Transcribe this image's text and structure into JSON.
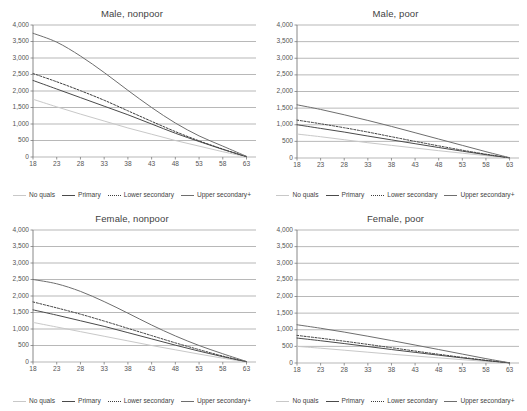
{
  "figure": {
    "panel_count": 4,
    "background": "#ffffff",
    "grid_color": "#9a9a9a",
    "axis_color": "#7a7a7a",
    "text_color": "#3f3f3f"
  },
  "series_style": {
    "No quals": {
      "color": "#c8c8c8",
      "dash": "none",
      "width": 1.0
    },
    "Primary": {
      "color": "#4a4a4a",
      "dash": "none",
      "width": 1.0
    },
    "Lower secondary": {
      "color": "#3d3d3d",
      "dash": "2,1.6",
      "width": 1.0
    },
    "Upper secondary+": {
      "color": "#6e6e6e",
      "dash": "none",
      "width": 1.0
    }
  },
  "legend": {
    "items": [
      {
        "label": "No quals"
      },
      {
        "label": "Primary"
      },
      {
        "label": "Lower secondary"
      },
      {
        "label": "Upper secondary+"
      }
    ]
  },
  "chart_data": [
    {
      "type": "line",
      "title": "Male, nonpoor",
      "xlabel": "",
      "ylabel": "",
      "xlim": [
        18,
        65
      ],
      "ylim": [
        0,
        4000
      ],
      "grid": true,
      "legend_position": "bottom",
      "xticks": [
        18,
        23,
        28,
        33,
        38,
        43,
        48,
        53,
        58,
        63
      ],
      "xtick_labels": [
        "18",
        "23",
        "28",
        "33",
        "38",
        "43",
        "48",
        "53",
        "58",
        "63"
      ],
      "yticks": [
        0,
        500,
        1000,
        1500,
        2000,
        2500,
        3000,
        3500,
        4000
      ],
      "ytick_labels": [
        "0",
        "500",
        "1,000",
        "1,500",
        "2,000",
        "2,500",
        "3,000",
        "3,500",
        "4,000"
      ],
      "x": [
        18,
        23,
        28,
        33,
        38,
        43,
        48,
        53,
        58,
        63
      ],
      "series": [
        {
          "name": "No quals",
          "values": [
            1750,
            1520,
            1300,
            1090,
            880,
            690,
            500,
            330,
            160,
            10
          ]
        },
        {
          "name": "Primary",
          "values": [
            2320,
            2060,
            1800,
            1540,
            1280,
            1000,
            720,
            470,
            230,
            10
          ]
        },
        {
          "name": "Lower secondary",
          "values": [
            2530,
            2280,
            2010,
            1720,
            1400,
            1080,
            770,
            490,
            240,
            10
          ]
        },
        {
          "name": "Upper secondary+",
          "values": [
            3750,
            3480,
            3060,
            2560,
            2020,
            1500,
            1030,
            640,
            330,
            20
          ]
        }
      ]
    },
    {
      "type": "line",
      "title": "Male, poor",
      "xlabel": "",
      "ylabel": "",
      "xlim": [
        18,
        65
      ],
      "ylim": [
        0,
        4000
      ],
      "grid": true,
      "legend_position": "bottom",
      "xticks": [
        18,
        23,
        28,
        33,
        38,
        43,
        48,
        53,
        58,
        63
      ],
      "xtick_labels": [
        "18",
        "23",
        "28",
        "33",
        "38",
        "43",
        "48",
        "53",
        "58",
        "63"
      ],
      "yticks": [
        0,
        500,
        1000,
        1500,
        2000,
        2500,
        3000,
        3500,
        4000
      ],
      "ytick_labels": [
        "0",
        "500",
        "1,000",
        "1,500",
        "2,000",
        "2,500",
        "3,000",
        "3,500",
        "4,000"
      ],
      "x": [
        18,
        23,
        28,
        33,
        38,
        43,
        48,
        53,
        58,
        63
      ],
      "series": [
        {
          "name": "No quals",
          "values": [
            720,
            640,
            550,
            460,
            380,
            300,
            220,
            145,
            70,
            5
          ]
        },
        {
          "name": "Primary",
          "values": [
            1000,
            890,
            780,
            660,
            545,
            430,
            315,
            205,
            100,
            5
          ]
        },
        {
          "name": "Lower secondary",
          "values": [
            1140,
            1030,
            910,
            780,
            640,
            500,
            365,
            235,
            115,
            5
          ]
        },
        {
          "name": "Upper secondary+",
          "values": [
            1600,
            1460,
            1300,
            1130,
            950,
            760,
            570,
            380,
            190,
            10
          ]
        }
      ]
    },
    {
      "type": "line",
      "title": "Female, nonpoor",
      "xlabel": "",
      "ylabel": "",
      "xlim": [
        18,
        65
      ],
      "ylim": [
        0,
        4000
      ],
      "grid": true,
      "legend_position": "bottom",
      "xticks": [
        18,
        23,
        28,
        33,
        38,
        43,
        48,
        53,
        58,
        63
      ],
      "xtick_labels": [
        "18",
        "23",
        "28",
        "33",
        "38",
        "43",
        "48",
        "53",
        "58",
        "63"
      ],
      "yticks": [
        0,
        500,
        1000,
        1500,
        2000,
        2500,
        3000,
        3500,
        4000
      ],
      "ytick_labels": [
        "0",
        "500",
        "1,000",
        "1,500",
        "2,000",
        "2,500",
        "3,000",
        "3,500",
        "4,000"
      ],
      "x": [
        18,
        23,
        28,
        33,
        38,
        43,
        48,
        53,
        58,
        63
      ],
      "series": [
        {
          "name": "No quals",
          "values": [
            1200,
            1060,
            920,
            780,
            640,
            500,
            370,
            240,
            115,
            5
          ]
        },
        {
          "name": "Primary",
          "values": [
            1580,
            1420,
            1250,
            1080,
            890,
            700,
            510,
            330,
            160,
            10
          ]
        },
        {
          "name": "Lower secondary",
          "values": [
            1820,
            1640,
            1450,
            1240,
            1020,
            800,
            580,
            375,
            180,
            10
          ]
        },
        {
          "name": "Upper secondary+",
          "values": [
            2500,
            2370,
            2140,
            1830,
            1480,
            1120,
            790,
            500,
            250,
            15
          ]
        }
      ]
    },
    {
      "type": "line",
      "title": "Female, poor",
      "xlabel": "",
      "ylabel": "",
      "xlim": [
        18,
        65
      ],
      "ylim": [
        0,
        4000
      ],
      "grid": true,
      "legend_position": "bottom",
      "xticks": [
        18,
        23,
        28,
        33,
        38,
        43,
        48,
        53,
        58,
        63
      ],
      "xtick_labels": [
        "18",
        "23",
        "28",
        "33",
        "38",
        "43",
        "48",
        "53",
        "58",
        "63"
      ],
      "yticks": [
        0,
        500,
        1000,
        1500,
        2000,
        2500,
        3000,
        3500,
        4000
      ],
      "ytick_labels": [
        "0",
        "500",
        "1,000",
        "1,500",
        "2,000",
        "2,500",
        "3,000",
        "3,500",
        "4,000"
      ],
      "x": [
        18,
        23,
        28,
        33,
        38,
        43,
        48,
        53,
        58,
        63
      ],
      "series": [
        {
          "name": "No quals",
          "values": [
            500,
            445,
            385,
            325,
            265,
            210,
            155,
            100,
            48,
            3
          ]
        },
        {
          "name": "Primary",
          "values": [
            750,
            670,
            585,
            495,
            405,
            320,
            235,
            152,
            73,
            4
          ]
        },
        {
          "name": "Lower secondary",
          "values": [
            830,
            745,
            655,
            560,
            460,
            360,
            262,
            170,
            82,
            4
          ]
        },
        {
          "name": "Upper secondary+",
          "values": [
            1150,
            1045,
            930,
            805,
            675,
            540,
            405,
            268,
            132,
            6
          ]
        }
      ]
    }
  ]
}
